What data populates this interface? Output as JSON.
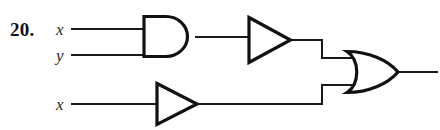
{
  "figure": {
    "problem_number": "20.",
    "type": "logic-circuit-diagram",
    "background_color": "#ffffff",
    "line_color": "#111111"
  },
  "inputs": [
    {
      "id": "in-1",
      "label": "x",
      "x": 57,
      "y": 29
    },
    {
      "id": "in-2",
      "label": "y",
      "x": 57,
      "y": 55
    },
    {
      "id": "in-3",
      "label": "x",
      "x": 57,
      "y": 104
    }
  ],
  "gates": [
    {
      "id": "and-gate-1",
      "kind": "and-gate",
      "left": 142,
      "top": 15,
      "right": 197,
      "bottom": 57,
      "output_y": 37
    },
    {
      "id": "buffer-gate-1",
      "kind": "buffer-gate",
      "left": 247,
      "top": 16,
      "right": 292,
      "bottom": 63,
      "output_y": 40
    },
    {
      "id": "buffer-gate-2",
      "kind": "buffer-gate",
      "left": 155,
      "top": 82,
      "right": 198,
      "bottom": 126,
      "output_y": 104
    },
    {
      "id": "or-gate-1",
      "kind": "or-gate",
      "left": 345,
      "top": 50,
      "right": 400,
      "bottom": 95,
      "output_y": 72
    }
  ],
  "wires": [
    {
      "id": "wire-x-to-and",
      "path": "M 72 29 L 144 29"
    },
    {
      "id": "wire-y-to-and",
      "path": "M 72 55 L 144 55"
    },
    {
      "id": "wire-and-to-buffer1",
      "path": "M 196 37 L 248 37"
    },
    {
      "id": "wire-buffer1-to-or",
      "path": "M 291 40 L 322 40 L 322 58 L 352 58"
    },
    {
      "id": "wire-x-to-buffer2",
      "path": "M 72 104 L 157 104"
    },
    {
      "id": "wire-buffer2-to-or",
      "path": "M 197 104 L 322 104 L 322 85 L 352 85"
    },
    {
      "id": "wire-or-output",
      "path": "M 399 72 L 437 72"
    }
  ],
  "output": {
    "id": "circuit-output",
    "label": "",
    "y": 72,
    "x_end": 437
  }
}
